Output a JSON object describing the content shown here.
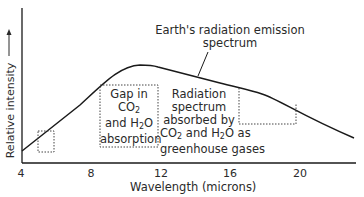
{
  "diagram": {
    "title_annotation": [
      "Earth's radiation emission",
      "spectrum"
    ],
    "y_axis_label": "Relative intensity",
    "x_axis_label": "Wavelength (microns)",
    "x_ticks": [
      "4",
      "8",
      "12",
      "16",
      "20"
    ],
    "gap_label": {
      "line1": "Gap in",
      "line2_pre": "CO",
      "line2_sub": "2",
      "line3_pre": "and H",
      "line3_sub": "2",
      "line3_post": "O",
      "line4": "absorption"
    },
    "absorbed_label": {
      "line1": "Radiation",
      "line2": "spectrum",
      "line3": "absorbed by",
      "line4_a": "CO",
      "line4_sub1": "2",
      "line4_b": " and H",
      "line4_sub2": "2",
      "line4_c": "O as",
      "line5": "greenhouse gases"
    },
    "colors": {
      "line": "#1a1a1a",
      "text": "#2a2a2a"
    }
  }
}
